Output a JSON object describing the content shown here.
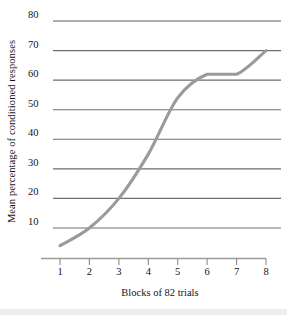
{
  "chart_data": {
    "type": "line",
    "title": "",
    "xlabel": "Blocks of 82 trials",
    "ylabel": "Mean percentage of conditioned responses",
    "x": [
      1,
      2,
      3,
      4,
      5,
      6,
      7,
      8
    ],
    "values": [
      4,
      10,
      20,
      35,
      54,
      62,
      62,
      70
    ],
    "series": [
      {
        "name": "Mean percentage of conditioned responses",
        "values": [
          4,
          10,
          20,
          35,
          54,
          62,
          62,
          70
        ]
      }
    ],
    "xlim": [
      1,
      8
    ],
    "ylim": [
      0,
      80
    ],
    "xticks": [
      1,
      2,
      3,
      4,
      5,
      6,
      7,
      8
    ],
    "xtick_labels": [
      "1",
      "2",
      "3",
      "4",
      "5",
      "6",
      "7",
      "8"
    ],
    "yticks": [
      10,
      20,
      30,
      40,
      50,
      60,
      70,
      80
    ],
    "ytick_labels": [
      "10",
      "20",
      "30",
      "40",
      "50",
      "60",
      "70",
      "80"
    ],
    "grid": "horizontal",
    "legend": "none",
    "line_color": "#9a9a98",
    "grid_color": "#6e6e6c",
    "axis_color": "#8a8a88",
    "background": "#ffffff"
  },
  "axes": {
    "y_title": "Mean percentage of conditioned responses",
    "x_title": "Blocks of 82 trials"
  }
}
